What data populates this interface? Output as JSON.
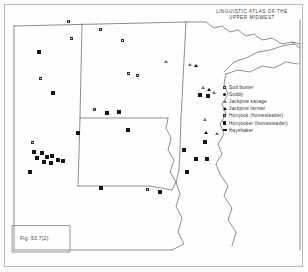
{
  "figure": {
    "title_line1": "LINGUISTIC  ATLAS  OF  THE",
    "title_line2": "UPPER  MIDWEST",
    "caption": "Fig. 53.7(2)"
  },
  "legend": {
    "items": [
      {
        "symbol": "open-square",
        "label": "Sod buster"
      },
      {
        "symbol": "filled-circle",
        "label": "Soddy"
      },
      {
        "symbol": "open-triangle",
        "label": "Jackpine savage"
      },
      {
        "symbol": "filled-triangle",
        "label": "Jackpine farmer"
      },
      {
        "symbol": "open-square",
        "label": "Honyock (homesteader)"
      },
      {
        "symbol": "filled-square",
        "label": "Honyocker (homesteader)"
      },
      {
        "symbol": "filled-rect",
        "label": "Hayshaker"
      }
    ]
  },
  "map": {
    "colors": {
      "ink": "#3a3a40",
      "marker": "#141414",
      "frame": "#b9b9b4"
    },
    "states_outline": "M14,22 L14,247 L228,247 L228,200 L300,150 L300,20 Z",
    "markers": [
      {
        "symbol": "open-square",
        "x": 69,
        "y": 22
      },
      {
        "symbol": "open-square",
        "x": 101,
        "y": 30
      },
      {
        "symbol": "open-square",
        "x": 72,
        "y": 39
      },
      {
        "symbol": "filled-square",
        "x": 39,
        "y": 52
      },
      {
        "symbol": "open-square",
        "x": 123,
        "y": 41
      },
      {
        "symbol": "open-square",
        "x": 41,
        "y": 79
      },
      {
        "symbol": "filled-square",
        "x": 53,
        "y": 93
      },
      {
        "symbol": "open-square",
        "x": 129,
        "y": 74
      },
      {
        "symbol": "open-square",
        "x": 138,
        "y": 76
      },
      {
        "symbol": "open-square",
        "x": 95,
        "y": 110
      },
      {
        "symbol": "filled-square",
        "x": 107,
        "y": 113
      },
      {
        "symbol": "filled-square",
        "x": 119,
        "y": 112
      },
      {
        "symbol": "filled-square",
        "x": 128,
        "y": 130
      },
      {
        "symbol": "filled-square",
        "x": 78,
        "y": 133
      },
      {
        "symbol": "open-square",
        "x": 33,
        "y": 143
      },
      {
        "symbol": "filled-square",
        "x": 34,
        "y": 152
      },
      {
        "symbol": "filled-square",
        "x": 42,
        "y": 153
      },
      {
        "symbol": "filled-square",
        "x": 37,
        "y": 158
      },
      {
        "symbol": "filled-square",
        "x": 47,
        "y": 157
      },
      {
        "symbol": "filled-square",
        "x": 52,
        "y": 156
      },
      {
        "symbol": "filled-square",
        "x": 44,
        "y": 162
      },
      {
        "symbol": "filled-square",
        "x": 51,
        "y": 163
      },
      {
        "symbol": "filled-square",
        "x": 58,
        "y": 160
      },
      {
        "symbol": "filled-square",
        "x": 63,
        "y": 161
      },
      {
        "symbol": "filled-square",
        "x": 30,
        "y": 172
      },
      {
        "symbol": "filled-square",
        "x": 101,
        "y": 188
      },
      {
        "symbol": "open-square",
        "x": 148,
        "y": 190
      },
      {
        "symbol": "filled-square",
        "x": 160,
        "y": 192
      },
      {
        "symbol": "open-triangle",
        "x": 190,
        "y": 65
      },
      {
        "symbol": "filled-triangle",
        "x": 196,
        "y": 66
      },
      {
        "symbol": "open-triangle",
        "x": 203,
        "y": 88
      },
      {
        "symbol": "filled-triangle",
        "x": 209,
        "y": 90
      },
      {
        "symbol": "filled-square",
        "x": 200,
        "y": 95
      },
      {
        "symbol": "filled-square",
        "x": 208,
        "y": 96
      },
      {
        "symbol": "open-triangle",
        "x": 214,
        "y": 93
      },
      {
        "symbol": "open-triangle",
        "x": 205,
        "y": 120
      },
      {
        "symbol": "filled-triangle",
        "x": 206,
        "y": 133
      },
      {
        "symbol": "open-triangle",
        "x": 217,
        "y": 134
      },
      {
        "symbol": "filled-square",
        "x": 205,
        "y": 142
      },
      {
        "symbol": "filled-square",
        "x": 184,
        "y": 150
      },
      {
        "symbol": "filled-square",
        "x": 196,
        "y": 159
      },
      {
        "symbol": "filled-square",
        "x": 207,
        "y": 159
      },
      {
        "symbol": "filled-square",
        "x": 187,
        "y": 172
      },
      {
        "symbol": "open-triangle",
        "x": 166,
        "y": 62
      }
    ]
  }
}
